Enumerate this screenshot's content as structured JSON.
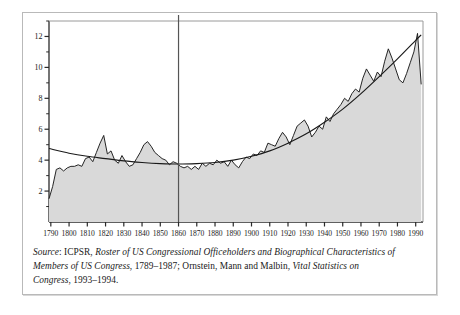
{
  "figure": {
    "caption_lines": [
      "Source: ICPSR, Roster of US Congressional Officeholders and Biographical Characteristics of",
      "Members of US Congress, 1789–1987; Ornstein, Mann and Malbin, Vital Statistics on",
      "Congress, 1993–1994."
    ],
    "caption_segments": [
      [
        {
          "t": "Source",
          "style": "italic"
        },
        {
          "t": ": ICPSR, ",
          "style": "normal"
        },
        {
          "t": "Roster of US Congressional Officeholders and Biographical Characteristics of",
          "style": "italic"
        }
      ],
      [
        {
          "t": "Members of US Congress",
          "style": "italic"
        },
        {
          "t": ", 1789–1987; Ornstein, Mann and Malbin, ",
          "style": "normal"
        },
        {
          "t": "Vital Statistics on",
          "style": "italic"
        }
      ],
      [
        {
          "t": "Congress",
          "style": "italic"
        },
        {
          "t": ", 1993–1994.",
          "style": "normal"
        }
      ]
    ]
  },
  "chart_data": {
    "type": "line",
    "title": "",
    "xlabel": "",
    "ylabel": "",
    "xlim": [
      1789,
      1994
    ],
    "ylim": [
      0,
      13
    ],
    "grid": false,
    "legend": "none",
    "xticks": [
      1790,
      1800,
      1810,
      1820,
      1830,
      1840,
      1850,
      1860,
      1870,
      1880,
      1890,
      1900,
      1910,
      1920,
      1930,
      1940,
      1950,
      1960,
      1970,
      1980,
      1990
    ],
    "xtick_labels": [
      "1790",
      "1800",
      "1810",
      "1820",
      "1830",
      "1840",
      "1850",
      "1860",
      "1870",
      "1880",
      "1890",
      "1900",
      "1910",
      "1920",
      "1930",
      "1940",
      "1950",
      "1960",
      "1970",
      "1980",
      "1990"
    ],
    "yticks_major": [
      2,
      4,
      6,
      8,
      10,
      12
    ],
    "ytick_labels": [
      "2",
      "4",
      "6",
      "8",
      "10",
      "12"
    ],
    "yticks_minor": [
      1,
      3,
      5,
      7,
      9,
      11,
      13
    ],
    "annotations": [
      {
        "type": "vline",
        "x": 1860,
        "label": "1860"
      }
    ],
    "series": [
      {
        "name": "observed",
        "style": "line-with-area-fill",
        "fill_color": "#d9d9d9",
        "line_color": "#1a1a1a",
        "x": [
          1789,
          1791,
          1793,
          1795,
          1797,
          1799,
          1801,
          1803,
          1805,
          1807,
          1809,
          1811,
          1813,
          1815,
          1817,
          1819,
          1821,
          1823,
          1825,
          1827,
          1829,
          1831,
          1833,
          1835,
          1837,
          1839,
          1841,
          1843,
          1845,
          1847,
          1849,
          1851,
          1853,
          1855,
          1857,
          1859,
          1861,
          1863,
          1865,
          1867,
          1869,
          1871,
          1873,
          1875,
          1877,
          1879,
          1881,
          1883,
          1885,
          1887,
          1889,
          1891,
          1893,
          1895,
          1897,
          1899,
          1901,
          1903,
          1905,
          1907,
          1909,
          1911,
          1913,
          1915,
          1917,
          1919,
          1921,
          1923,
          1925,
          1927,
          1929,
          1931,
          1933,
          1935,
          1937,
          1939,
          1941,
          1943,
          1945,
          1947,
          1949,
          1951,
          1953,
          1955,
          1957,
          1959,
          1961,
          1963,
          1965,
          1967,
          1969,
          1971,
          1973,
          1975,
          1977,
          1979,
          1981,
          1983,
          1985,
          1987,
          1989,
          1991,
          1993
        ],
        "y": [
          1.5,
          2.3,
          3.4,
          3.5,
          3.3,
          3.5,
          3.6,
          3.6,
          3.7,
          3.6,
          4.1,
          4.2,
          3.9,
          4.5,
          5.1,
          5.6,
          4.4,
          4.6,
          4.0,
          3.8,
          4.3,
          3.9,
          3.6,
          3.7,
          4.1,
          4.5,
          5.0,
          5.2,
          4.9,
          4.5,
          4.3,
          4.1,
          4.0,
          3.7,
          3.9,
          3.8,
          3.6,
          3.5,
          3.6,
          3.4,
          3.6,
          3.4,
          3.8,
          3.6,
          3.8,
          3.7,
          4.0,
          3.8,
          3.9,
          3.6,
          4.0,
          3.7,
          3.5,
          3.9,
          4.2,
          4.1,
          4.4,
          4.3,
          4.6,
          4.5,
          5.1,
          5.0,
          4.9,
          5.4,
          5.8,
          5.5,
          5.0,
          5.6,
          6.2,
          6.4,
          6.6,
          6.2,
          5.5,
          5.8,
          6.2,
          6.0,
          6.8,
          6.5,
          7.0,
          7.3,
          7.6,
          8.0,
          7.8,
          8.3,
          8.6,
          8.4,
          9.3,
          9.9,
          9.5,
          9.1,
          9.7,
          9.4,
          10.4,
          11.2,
          10.6,
          9.9,
          9.2,
          9.0,
          9.6,
          10.3,
          11.0,
          12.2,
          8.9
        ]
      },
      {
        "name": "trend",
        "style": "smooth-line",
        "line_color": "#1a1a1a",
        "x": [
          1789,
          1800,
          1810,
          1820,
          1830,
          1840,
          1850,
          1860,
          1870,
          1880,
          1890,
          1900,
          1910,
          1920,
          1930,
          1940,
          1950,
          1960,
          1970,
          1980,
          1990,
          1993
        ],
        "y": [
          4.75,
          4.45,
          4.25,
          4.1,
          3.95,
          3.85,
          3.78,
          3.75,
          3.78,
          3.85,
          4.0,
          4.25,
          4.6,
          5.1,
          5.7,
          6.45,
          7.3,
          8.3,
          9.4,
          10.55,
          11.75,
          12.1
        ]
      }
    ]
  }
}
